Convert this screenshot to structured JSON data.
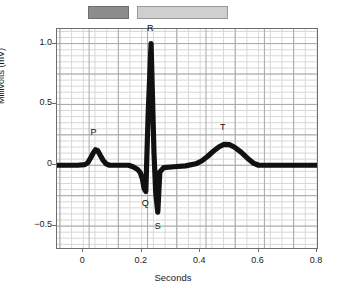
{
  "figure": {
    "background_color": "#ffffff",
    "trace_color": "#111111",
    "grid_minor_color": "#d8d8d8",
    "grid_major_color": "#a8a8a8",
    "frame_color": "#6e6e6e"
  },
  "phase_bars": [
    {
      "name": "dark-phase-bar",
      "fill": "#8c8c8c",
      "stroke": "#6e6e6e",
      "label": ""
    },
    {
      "name": "light-phase-bar",
      "fill": "#cfcfcf",
      "stroke": "#9a9a9a",
      "label": ""
    }
  ],
  "chart_data": {
    "type": "line",
    "title": "",
    "xlabel": "Seconds",
    "ylabel": "Millivolts (mV)",
    "xlim": [
      -0.09,
      0.8
    ],
    "ylim": [
      -0.68,
      1.12
    ],
    "xticks": [
      0,
      0.2,
      0.4,
      0.6,
      0.8
    ],
    "xtick_labels": [
      "0",
      "0.2",
      "0.4",
      "0.6",
      "0.8"
    ],
    "yticks": [
      1.0,
      0.5,
      0,
      -0.5
    ],
    "ytick_labels": [
      "1.0",
      "0.5",
      "0",
      "-0.5"
    ],
    "grid": true,
    "grid_minor_step_x": 0.04,
    "grid_minor_step_y": 0.05,
    "grid_major_step_x": 0.1,
    "grid_major_step_y": 0.25,
    "legend": "none",
    "series": [
      {
        "name": "ECG waveform",
        "color": "#111111",
        "x": [
          -0.09,
          -0.02,
          0.005,
          0.015,
          0.025,
          0.035,
          0.042,
          0.05,
          0.058,
          0.068,
          0.078,
          0.09,
          0.12,
          0.155,
          0.17,
          0.185,
          0.195,
          0.202,
          0.208,
          0.214,
          0.222,
          0.232,
          0.242,
          0.248,
          0.255,
          0.262,
          0.275,
          0.31,
          0.35,
          0.385,
          0.405,
          0.425,
          0.445,
          0.465,
          0.482,
          0.5,
          0.518,
          0.54,
          0.562,
          0.582,
          0.6,
          0.625,
          0.68,
          0.74,
          0.8
        ],
        "y": [
          0,
          0,
          0.005,
          0.02,
          0.06,
          0.105,
          0.128,
          0.118,
          0.082,
          0.04,
          0.012,
          0,
          0,
          0,
          -0.012,
          -0.032,
          -0.06,
          -0.11,
          -0.19,
          -0.215,
          0.42,
          1.0,
          0.1,
          -0.23,
          -0.385,
          -0.055,
          -0.02,
          -0.012,
          -0.005,
          0.012,
          0.035,
          0.072,
          0.115,
          0.152,
          0.172,
          0.17,
          0.148,
          0.108,
          0.058,
          0.018,
          0,
          0,
          0,
          0,
          0
        ]
      }
    ],
    "annotations": [
      {
        "label": "P",
        "x": 0.042,
        "y": 0.128,
        "note": "P wave peak ~0.13 mV at ~0.04 s"
      },
      {
        "label": "Q",
        "x": 0.214,
        "y": -0.215,
        "note": "Q trough ~-0.22 mV at ~0.21 s"
      },
      {
        "label": "R",
        "x": 0.232,
        "y": 1.0,
        "note": "R peak 1.0 mV at ~0.23 s"
      },
      {
        "label": "S",
        "x": 0.255,
        "y": -0.385,
        "note": "S trough ~-0.39 mV at ~0.25 s"
      },
      {
        "label": "T",
        "x": 0.482,
        "y": 0.172,
        "note": "T wave peak ~0.17 mV at ~0.48 s"
      }
    ]
  }
}
